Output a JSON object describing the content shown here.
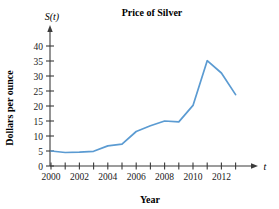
{
  "chart_data": {
    "type": "line",
    "title": "Price of Silver",
    "xlabel": "Year",
    "ylabel": "Dollars per ounce",
    "x_axis_var": "t",
    "y_axis_var": "S(t)",
    "x": [
      2000,
      2001,
      2002,
      2003,
      2004,
      2005,
      2006,
      2007,
      2008,
      2009,
      2010,
      2011,
      2012,
      2013
    ],
    "values": [
      5.0,
      4.5,
      4.6,
      4.9,
      6.7,
      7.3,
      11.5,
      13.4,
      15.0,
      14.7,
      20.2,
      35.1,
      31.0,
      23.8
    ],
    "xlim": [
      2000,
      2013
    ],
    "ylim": [
      0,
      43
    ],
    "y_ticks": [
      0,
      5,
      10,
      15,
      20,
      25,
      30,
      35,
      40
    ],
    "y_tick_labels": [
      "0",
      "5",
      "10",
      "15",
      "20",
      "25",
      "30",
      "35",
      "40"
    ],
    "x_ticks": [
      2000,
      2001,
      2002,
      2003,
      2004,
      2005,
      2006,
      2007,
      2008,
      2009,
      2010,
      2011,
      2012,
      2013
    ],
    "x_tick_labels": [
      "2000",
      "",
      "2002",
      "",
      "2004",
      "",
      "2006",
      "",
      "2008",
      "",
      "2010",
      "",
      "2012",
      ""
    ],
    "grid": false,
    "legend": "none",
    "line_color": "#5b9bd2",
    "axis_color": "#3b3b3b",
    "text_color": "#1a1a1a",
    "background": "#ffffff"
  },
  "labels": {
    "title": "Price of Silver",
    "y_axis_variable": "S(t)",
    "y_axis_name": "Dollars per ounce",
    "x_axis_name": "Year",
    "x_axis_variable": "t",
    "y0": "0",
    "y5": "5",
    "y10": "10",
    "y15": "15",
    "y20": "20",
    "y25": "25",
    "y30": "30",
    "y35": "35",
    "y40": "40",
    "x2000": "2000",
    "x2002": "2002",
    "x2004": "2004",
    "x2006": "2006",
    "x2008": "2008",
    "x2010": "2010",
    "x2012": "2012"
  }
}
